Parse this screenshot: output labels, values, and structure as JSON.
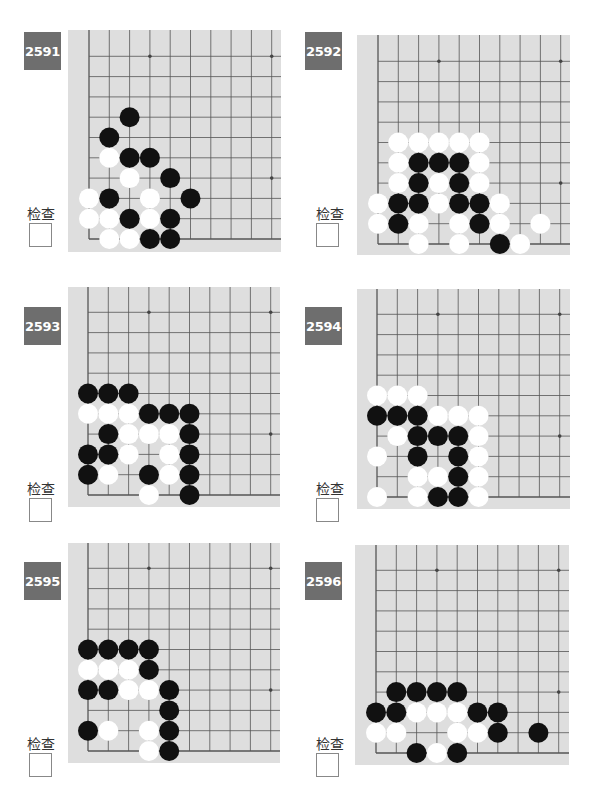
{
  "page": {
    "check_label": "检查",
    "problems": [
      {
        "number": "2591",
        "black": [
          [
            2,
            6
          ],
          [
            1,
            5
          ],
          [
            2,
            4
          ],
          [
            3,
            4
          ],
          [
            4,
            3
          ],
          [
            1,
            2
          ],
          [
            5,
            2
          ],
          [
            2,
            1
          ],
          [
            4,
            1
          ],
          [
            3,
            0
          ],
          [
            4,
            0
          ]
        ],
        "white": [
          [
            1,
            4
          ],
          [
            2,
            3
          ],
          [
            0,
            2
          ],
          [
            3,
            2
          ],
          [
            0,
            1
          ],
          [
            1,
            1
          ],
          [
            3,
            1
          ],
          [
            1,
            0
          ],
          [
            2,
            0
          ]
        ]
      },
      {
        "number": "2592",
        "black": [
          [
            2,
            4
          ],
          [
            3,
            4
          ],
          [
            4,
            4
          ],
          [
            2,
            3
          ],
          [
            4,
            3
          ],
          [
            1,
            2
          ],
          [
            2,
            2
          ],
          [
            4,
            2
          ],
          [
            5,
            2
          ],
          [
            1,
            1
          ],
          [
            5,
            1
          ],
          [
            6,
            0
          ]
        ],
        "white": [
          [
            1,
            5
          ],
          [
            2,
            5
          ],
          [
            3,
            5
          ],
          [
            4,
            5
          ],
          [
            5,
            5
          ],
          [
            1,
            4
          ],
          [
            5,
            4
          ],
          [
            1,
            3
          ],
          [
            3,
            3
          ],
          [
            5,
            3
          ],
          [
            0,
            2
          ],
          [
            3,
            2
          ],
          [
            6,
            2
          ],
          [
            0,
            1
          ],
          [
            2,
            1
          ],
          [
            4,
            1
          ],
          [
            6,
            1
          ],
          [
            8,
            1
          ],
          [
            2,
            0
          ],
          [
            4,
            0
          ],
          [
            7,
            0
          ]
        ]
      },
      {
        "number": "2593",
        "black": [
          [
            0,
            5
          ],
          [
            1,
            5
          ],
          [
            2,
            5
          ],
          [
            3,
            4
          ],
          [
            4,
            4
          ],
          [
            5,
            4
          ],
          [
            1,
            3
          ],
          [
            5,
            3
          ],
          [
            0,
            2
          ],
          [
            1,
            2
          ],
          [
            5,
            2
          ],
          [
            0,
            1
          ],
          [
            3,
            1
          ],
          [
            5,
            1
          ],
          [
            5,
            0
          ]
        ],
        "white": [
          [
            0,
            4
          ],
          [
            1,
            4
          ],
          [
            2,
            4
          ],
          [
            2,
            3
          ],
          [
            3,
            3
          ],
          [
            4,
            3
          ],
          [
            2,
            2
          ],
          [
            4,
            2
          ],
          [
            1,
            1
          ],
          [
            4,
            1
          ],
          [
            3,
            0
          ]
        ]
      },
      {
        "number": "2594",
        "black": [
          [
            0,
            4
          ],
          [
            1,
            4
          ],
          [
            2,
            4
          ],
          [
            2,
            3
          ],
          [
            3,
            3
          ],
          [
            4,
            3
          ],
          [
            2,
            2
          ],
          [
            4,
            2
          ],
          [
            4,
            1
          ],
          [
            3,
            0
          ],
          [
            4,
            0
          ]
        ],
        "white": [
          [
            0,
            5
          ],
          [
            1,
            5
          ],
          [
            2,
            5
          ],
          [
            3,
            4
          ],
          [
            4,
            4
          ],
          [
            5,
            4
          ],
          [
            1,
            3
          ],
          [
            5,
            3
          ],
          [
            0,
            2
          ],
          [
            5,
            2
          ],
          [
            2,
            1
          ],
          [
            3,
            1
          ],
          [
            5,
            1
          ],
          [
            0,
            0
          ],
          [
            2,
            0
          ],
          [
            5,
            0
          ]
        ]
      },
      {
        "number": "2595",
        "black": [
          [
            0,
            5
          ],
          [
            1,
            5
          ],
          [
            2,
            5
          ],
          [
            3,
            5
          ],
          [
            3,
            4
          ],
          [
            0,
            3
          ],
          [
            1,
            3
          ],
          [
            4,
            3
          ],
          [
            4,
            2
          ],
          [
            0,
            1
          ],
          [
            4,
            1
          ],
          [
            4,
            0
          ]
        ],
        "white": [
          [
            0,
            4
          ],
          [
            1,
            4
          ],
          [
            2,
            4
          ],
          [
            2,
            3
          ],
          [
            3,
            3
          ],
          [
            1,
            1
          ],
          [
            3,
            1
          ],
          [
            3,
            0
          ]
        ]
      },
      {
        "number": "2596",
        "black": [
          [
            1,
            3
          ],
          [
            2,
            3
          ],
          [
            3,
            3
          ],
          [
            4,
            3
          ],
          [
            0,
            2
          ],
          [
            1,
            2
          ],
          [
            5,
            2
          ],
          [
            6,
            2
          ],
          [
            6,
            1
          ],
          [
            8,
            1
          ],
          [
            2,
            0
          ],
          [
            4,
            0
          ]
        ],
        "white": [
          [
            2,
            2
          ],
          [
            3,
            2
          ],
          [
            4,
            2
          ],
          [
            0,
            1
          ],
          [
            1,
            1
          ],
          [
            4,
            1
          ],
          [
            5,
            1
          ],
          [
            3,
            0
          ]
        ]
      }
    ]
  }
}
